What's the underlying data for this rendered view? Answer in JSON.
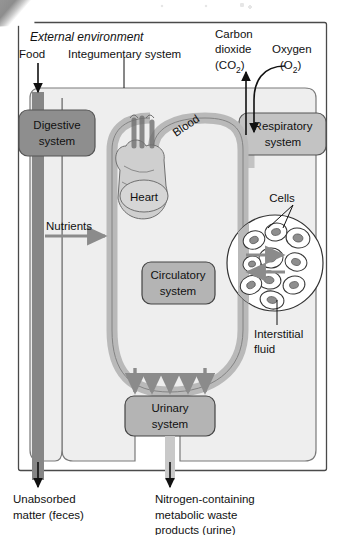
{
  "figure": {
    "title": "External environment",
    "title_style": "italic",
    "frame": {
      "border_color": "#4a4a4a",
      "background": "#ffffff"
    }
  },
  "colors": {
    "page_background": "#ffffff",
    "body_fill": "#eeeeee",
    "body_stroke": "#7a7a7a",
    "digestive_fill": "#8e8e8e",
    "digestive_stroke": "#555555",
    "respiratory_fill": "#c3c3c3",
    "respiratory_stroke": "#555555",
    "circulatory_fill": "#b4b4b4",
    "circulatory_stroke": "#444444",
    "urinary_fill": "#b4b4b4",
    "urinary_stroke": "#444444",
    "vessel_fill": "#b9b9b9",
    "vessel_stroke": "#7d7d7d",
    "arrow_gray": "#8b8b8b",
    "arrow_black": "#111111",
    "cell_fill": "#ffffff",
    "cell_stroke": "#333333",
    "nucleus_fill": "#8e8e8e",
    "text_color": "#111111"
  },
  "labels": {
    "external_environment": "External environment",
    "food": "Food",
    "integumentary_system": "Integumentary system",
    "carbon_dioxide_line1": "Carbon",
    "carbon_dioxide_line2": "dioxide",
    "carbon_dioxide_formula": "(CO",
    "carbon_dioxide_sub": "2",
    "carbon_dioxide_close": ")",
    "oxygen": "Oxygen",
    "oxygen_formula": "(O",
    "oxygen_sub": "2",
    "oxygen_close": ")",
    "blood": "Blood",
    "heart": "Heart",
    "nutrients": "Nutrients",
    "cells": "Cells",
    "interstitial_line1": "Interstitial",
    "interstitial_line2": "fluid",
    "unabsorbed_line1": "Unabsorbed",
    "unabsorbed_line2": "matter (feces)",
    "nitrogen_line1": "Nitrogen-containing",
    "nitrogen_line2": "metabolic waste",
    "nitrogen_line3": "products (urine)"
  },
  "organ_systems": [
    {
      "id": "digestive",
      "line1": "Digestive",
      "line2": "system",
      "fill": "#8e8e8e"
    },
    {
      "id": "respiratory",
      "line1": "Respiratory",
      "line2": "system",
      "fill": "#c3c3c3"
    },
    {
      "id": "circulatory",
      "line1": "Circulatory",
      "line2": "system",
      "fill": "#b4b4b4"
    },
    {
      "id": "urinary",
      "line1": "Urinary",
      "line2": "system",
      "fill": "#b4b4b4"
    }
  ],
  "flows": [
    {
      "id": "food-in",
      "label": "Food",
      "direction": "down",
      "style": "black-arrow"
    },
    {
      "id": "co2-out",
      "label": "Carbon dioxide (CO2)",
      "direction": "up",
      "style": "black-arrow"
    },
    {
      "id": "o2-in",
      "label": "Oxygen (O2)",
      "direction": "down",
      "style": "black-curved-arrow"
    },
    {
      "id": "nutrients-in",
      "label": "Nutrients",
      "direction": "right",
      "style": "gray-arrow"
    },
    {
      "id": "cells-exchange-out",
      "label": "",
      "direction": "right",
      "style": "gray-arrow"
    },
    {
      "id": "cells-exchange-in",
      "label": "",
      "direction": "left",
      "style": "gray-arrow"
    },
    {
      "id": "to-urinary",
      "label": "",
      "direction": "down",
      "style": "gray-arrow",
      "count": 5
    },
    {
      "id": "feces-out",
      "label": "Unabsorbed matter (feces)",
      "direction": "down",
      "style": "black-arrow"
    },
    {
      "id": "urine-out",
      "label": "Nitrogen-containing metabolic waste products (urine)",
      "direction": "down",
      "style": "black-arrow"
    }
  ],
  "cell_cluster": {
    "cell_count": 10,
    "description": "circle of tissue cells surrounded by interstitial fluid"
  }
}
